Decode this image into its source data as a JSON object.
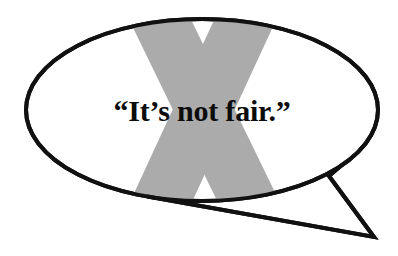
{
  "canvas": {
    "width": 398,
    "height": 256,
    "background_color": "#ffffff"
  },
  "illustration": {
    "kind": "speech-bubble-with-x-overlay",
    "bubble": {
      "shape": "ellipse",
      "fill_color": "#ffffff",
      "stroke_color": "#111111",
      "stroke_width": 4,
      "center_x": 202,
      "center_y": 110,
      "radius_x": 176,
      "radius_y": 91
    },
    "tail": {
      "shape": "polygon-pointer",
      "fill_color": "#ffffff",
      "stroke_color": "#111111",
      "stroke_width": 4,
      "tip_x": 374,
      "tip_y": 237,
      "notch_x": 329,
      "notch_y": 176
    },
    "x_mark": {
      "label": "X",
      "fill_color": "#ababab",
      "description": "large gray letter X clipped to the ellipse",
      "stroke_thickness": 62,
      "top_left_x": 122,
      "top_right_x": 283,
      "bottom_left_x": 124,
      "bottom_right_x": 286,
      "crossing_x": 203,
      "crossing_y": 114
    },
    "quote": {
      "text": "“It’s not fair.”",
      "plain_text": "It's not fair.",
      "color": "#0c0c0c",
      "font_size_px": 30,
      "font_weight": "bold",
      "center_x": 202,
      "baseline_y": 121,
      "text_anchor": "middle"
    }
  }
}
